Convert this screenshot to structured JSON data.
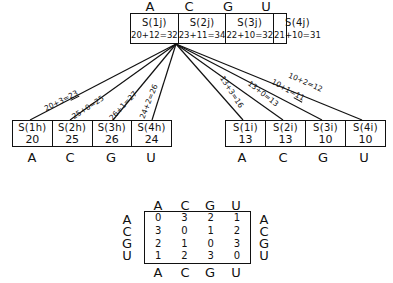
{
  "top": {
    "letters": [
      "A",
      "C",
      "G",
      "U"
    ],
    "cells": [
      {
        "label": "S(1j)",
        "value": "20+12=32"
      },
      {
        "label": "S(2j)",
        "value": "23+11=34"
      },
      {
        "label": "S(3j)",
        "value": "22+10=32"
      },
      {
        "label": "S(4j)",
        "value": "21+10=31"
      }
    ]
  },
  "left": {
    "cells": [
      {
        "label": "S(1h)",
        "value": "20"
      },
      {
        "label": "S(2h)",
        "value": "25"
      },
      {
        "label": "S(3h)",
        "value": "26"
      },
      {
        "label": "S(4h)",
        "value": "24"
      }
    ],
    "letters": [
      "A",
      "C",
      "G",
      "U"
    ],
    "edges": [
      {
        "pre": "20+3=",
        "result": "23",
        "underlined": true
      },
      {
        "pre": "25+0=",
        "result": "25",
        "underlined": false
      },
      {
        "pre": "26+1=",
        "result": "27",
        "underlined": false
      },
      {
        "pre": "24+2=",
        "result": "26",
        "underlined": false
      }
    ]
  },
  "right": {
    "cells": [
      {
        "label": "S(1i)",
        "value": "13"
      },
      {
        "label": "S(2i)",
        "value": "13"
      },
      {
        "label": "S(3i)",
        "value": "10"
      },
      {
        "label": "S(4i)",
        "value": "10"
      }
    ],
    "letters": [
      "A",
      "C",
      "G",
      "U"
    ],
    "edges": [
      {
        "pre": "13+3=",
        "result": "16",
        "underlined": false
      },
      {
        "pre": "13+0=",
        "result": "13",
        "underlined": false
      },
      {
        "pre": "10+1=",
        "result": "11",
        "underlined": true
      },
      {
        "pre": "10+2=",
        "result": "12",
        "underlined": false
      }
    ]
  },
  "matrix": {
    "col_letters": [
      "A",
      "C",
      "G",
      "U"
    ],
    "row_letters": [
      "A",
      "C",
      "G",
      "U"
    ],
    "rows": [
      [
        "0",
        "3",
        "2",
        "1"
      ],
      [
        "3",
        "0",
        "1",
        "2"
      ],
      [
        "2",
        "1",
        "0",
        "3"
      ],
      [
        "1",
        "2",
        "3",
        "0"
      ]
    ]
  }
}
